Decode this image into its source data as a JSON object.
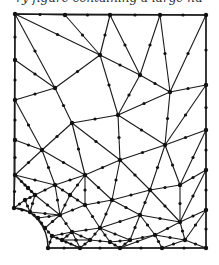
{
  "caption": "ry figure containing a large nu",
  "figure": {
    "type": "finite-element triangular mesh",
    "colors": {
      "line": "#1a1a1a",
      "background": "#ffffff"
    },
    "boundary": {
      "top_left": [
        15,
        14
      ],
      "top_right": [
        206,
        15
      ],
      "bottom_right": [
        206,
        248
      ],
      "bottom_left_arc_end": [
        48,
        248
      ],
      "left_arc_start": [
        14,
        208
      ]
    }
  }
}
